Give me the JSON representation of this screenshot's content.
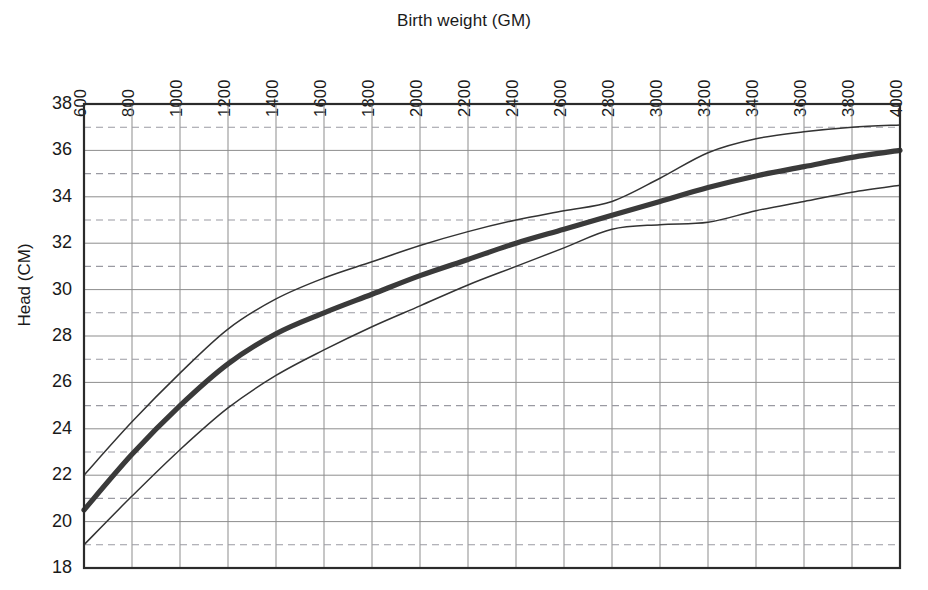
{
  "chart_data": {
    "type": "line",
    "title": "Birth weight (GM)",
    "xlabel": "Birth weight (GM)",
    "ylabel": "Head (CM)",
    "xlim": [
      600,
      4000
    ],
    "ylim": [
      18,
      38
    ],
    "x_tick_step": 200,
    "y_tick_step": 2,
    "grid": "solid gridlines at even head values and every 200 GM; dashed gridlines at odd head values",
    "legend_position": "none",
    "x_tick_labels": [
      "600",
      "800",
      "1000",
      "1200",
      "1400",
      "1600",
      "1800",
      "2000",
      "2200",
      "2400",
      "2600",
      "2800",
      "3000",
      "3200",
      "3400",
      "3600",
      "3800",
      "4000"
    ],
    "y_tick_labels": [
      "38",
      "36",
      "34",
      "32",
      "30",
      "28",
      "26",
      "24",
      "22",
      "20",
      "18"
    ],
    "x": [
      600,
      800,
      1000,
      1200,
      1400,
      1600,
      1800,
      2000,
      2200,
      2400,
      2600,
      2800,
      3000,
      3200,
      3400,
      3600,
      3800,
      4000
    ],
    "series": [
      {
        "name": "upper",
        "style": "thin",
        "color": "#333333",
        "values": [
          22.0,
          24.3,
          26.4,
          28.3,
          29.6,
          30.5,
          31.2,
          31.9,
          32.5,
          33.0,
          33.4,
          33.8,
          34.8,
          35.9,
          36.5,
          36.8,
          37.0,
          37.1
        ]
      },
      {
        "name": "median",
        "style": "thick",
        "color": "#3a3a3a",
        "values": [
          20.5,
          22.9,
          25.0,
          26.8,
          28.1,
          29.0,
          29.8,
          30.6,
          31.3,
          32.0,
          32.6,
          33.2,
          33.8,
          34.4,
          34.9,
          35.3,
          35.7,
          36.0
        ]
      },
      {
        "name": "lower",
        "style": "thin",
        "color": "#333333",
        "values": [
          19.0,
          21.1,
          23.1,
          24.9,
          26.3,
          27.4,
          28.4,
          29.3,
          30.2,
          31.0,
          31.8,
          32.6,
          32.8,
          32.9,
          33.4,
          33.8,
          34.2,
          34.5
        ]
      }
    ]
  },
  "axes": {
    "plot_left": 84,
    "plot_right": 900,
    "plot_top": 104,
    "plot_bottom": 568
  },
  "colors": {
    "grid_solid": "#8d8d8d",
    "grid_dashed": "#9a9aa2",
    "frame": "#2b2b2b",
    "curve": "#333333",
    "background": "#ffffff"
  }
}
